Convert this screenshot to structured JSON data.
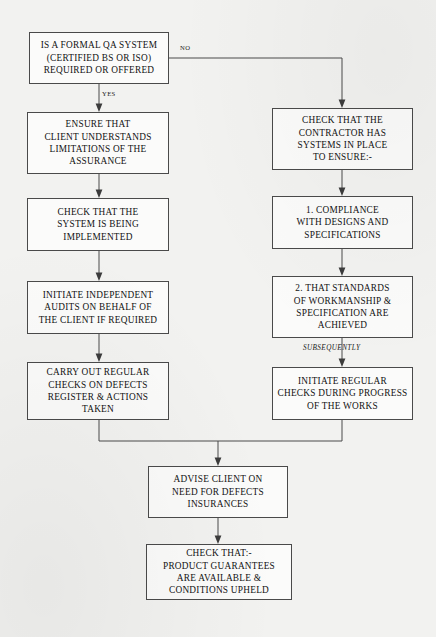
{
  "chart_data": {
    "type": "diagram",
    "nodes": [
      {
        "id": "qa-system-decision",
        "name": "qa-system-decision-box",
        "text": "IS A FORMAL QA SYSTEM\n(CERTIFIED BS OR ISO)\nREQUIRED OR OFFERED",
        "x": 29,
        "y": 32,
        "w": 140,
        "h": 52
      },
      {
        "id": "ensure-client-understands",
        "name": "ensure-client-understands-box",
        "text": "ENSURE THAT\nCLIENT UNDERSTANDS\nLIMITATIONS OF THE\nASSURANCE",
        "x": 27,
        "y": 112,
        "w": 142,
        "h": 62
      },
      {
        "id": "check-system-implemented",
        "name": "check-system-implemented-box",
        "text": "CHECK THAT THE\nSYSTEM IS BEING\nIMPLEMENTED",
        "x": 27,
        "y": 198,
        "w": 142,
        "h": 53
      },
      {
        "id": "initiate-independent-audits",
        "name": "initiate-independent-audits-box",
        "text": "INITIATE INDEPENDENT\nAUDITS ON BEHALF OF\nTHE CLIENT IF REQUIRED",
        "x": 27,
        "y": 281,
        "w": 142,
        "h": 53
      },
      {
        "id": "carry-out-regular-checks",
        "name": "carry-out-regular-checks-box",
        "text": "CARRY OUT REGULAR\nCHECKS ON DEFECTS\nREGISTER & ACTIONS\nTAKEN",
        "x": 27,
        "y": 362,
        "w": 142,
        "h": 58
      },
      {
        "id": "check-contractor-systems",
        "name": "check-contractor-systems-box",
        "text": "CHECK THAT THE\nCONTRACTOR HAS\nSYSTEMS IN PLACE\nTO ENSURE:-",
        "x": 272,
        "y": 108,
        "w": 141,
        "h": 62
      },
      {
        "id": "compliance-designs-specs",
        "name": "compliance-designs-specifications-box",
        "text": "1.  COMPLIANCE\nWITH DESIGNS AND\nSPECIFICATIONS",
        "x": 272,
        "y": 196,
        "w": 141,
        "h": 53
      },
      {
        "id": "standards-workmanship",
        "name": "standards-of-workmanship-box",
        "text": "2.  THAT STANDARDS\nOF WORKMANSHIP &\nSPECIFICATION ARE\nACHIEVED",
        "x": 272,
        "y": 276,
        "w": 141,
        "h": 62
      },
      {
        "id": "initiate-regular-checks",
        "name": "initiate-regular-checks-box",
        "text": "INITIATE REGULAR\nCHECKS DURING PROGRESS\nOF THE WORKS",
        "x": 272,
        "y": 367,
        "w": 141,
        "h": 53
      },
      {
        "id": "advise-client-defects-insurance",
        "name": "advise-client-defects-insurances-box",
        "text": "ADVISE CLIENT ON\nNEED FOR DEFECTS\nINSURANCES",
        "x": 148,
        "y": 466,
        "w": 140,
        "h": 52
      },
      {
        "id": "check-product-guarantees",
        "name": "check-product-guarantees-box",
        "text": "CHECK THAT:-\nPRODUCT GUARANTEES\nARE AVAILABLE &\nCONDITIONS UPHELD",
        "x": 146,
        "y": 544,
        "w": 146,
        "h": 56
      }
    ],
    "edge_labels": [
      {
        "id": "label-no",
        "name": "edge-label-no",
        "text": "NO",
        "x": 180,
        "y": 44,
        "italic": false
      },
      {
        "id": "label-yes",
        "name": "edge-label-yes",
        "text": "YES",
        "x": 102,
        "y": 90,
        "italic": false
      },
      {
        "id": "label-subsequently",
        "name": "edge-label-subsequently",
        "text": "SUBSEQUENTLY",
        "x": 303,
        "y": 344,
        "italic": true
      }
    ],
    "edges": [
      {
        "from": "qa-system-decision",
        "to": "ensure-client-understands",
        "label": "YES"
      },
      {
        "from": "qa-system-decision",
        "to": "check-contractor-systems",
        "label": "NO"
      },
      {
        "from": "ensure-client-understands",
        "to": "check-system-implemented",
        "label": ""
      },
      {
        "from": "check-system-implemented",
        "to": "initiate-independent-audits",
        "label": ""
      },
      {
        "from": "initiate-independent-audits",
        "to": "carry-out-regular-checks",
        "label": ""
      },
      {
        "from": "check-contractor-systems",
        "to": "compliance-designs-specs",
        "label": ""
      },
      {
        "from": "compliance-designs-specs",
        "to": "standards-workmanship",
        "label": ""
      },
      {
        "from": "standards-workmanship",
        "to": "initiate-regular-checks",
        "label": "SUBSEQUENTLY"
      },
      {
        "from": "carry-out-regular-checks",
        "to": "advise-client-defects-insurance",
        "label": ""
      },
      {
        "from": "initiate-regular-checks",
        "to": "advise-client-defects-insurance",
        "label": ""
      },
      {
        "from": "advise-client-defects-insurance",
        "to": "check-product-guarantees",
        "label": ""
      }
    ],
    "colors": {
      "background": "#f2f2f0",
      "box_fill": "#fbfbfa",
      "box_stroke": "#4a4a4a",
      "text": "#121212",
      "connector": "#4a4a4a"
    }
  }
}
